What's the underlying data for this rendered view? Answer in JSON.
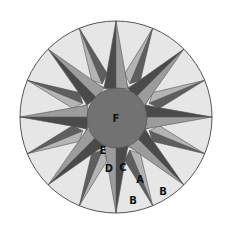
{
  "diagram": {
    "type": "mariners-compass-quilt-block",
    "center": [
      116,
      117
    ],
    "outer_radius": 96,
    "inner_radius": 30,
    "point_count": 16,
    "colors": {
      "background": "#e6e6e6",
      "outline": "#555555",
      "center_circle": "#727272",
      "main_dark": "#4a4a4a",
      "main_light": "#9c9c9c",
      "secondary_dark": "#5e5e5e",
      "secondary_light": "#b4b4b4",
      "wedge": "#d2d2d2"
    },
    "labels": [
      {
        "id": "F",
        "text": "F",
        "x": 116,
        "y": 122
      },
      {
        "id": "E",
        "text": "E",
        "x": 103,
        "y": 154
      },
      {
        "id": "D",
        "text": "D",
        "x": 109,
        "y": 172
      },
      {
        "id": "C",
        "text": "C",
        "x": 123,
        "y": 171
      },
      {
        "id": "A",
        "text": "A",
        "x": 140,
        "y": 183
      },
      {
        "id": "B1",
        "text": "B",
        "x": 133,
        "y": 204
      },
      {
        "id": "B2",
        "text": "B",
        "x": 163,
        "y": 195
      }
    ]
  }
}
